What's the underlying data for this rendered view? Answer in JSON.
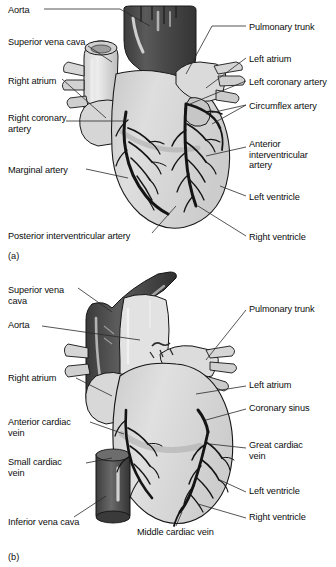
{
  "figure": {
    "colors": {
      "ink": "#0d0d0d",
      "leader": "#2a2a2a",
      "myocardium_light": "#dcdcdc",
      "myocardium_mid": "#c4c4c4",
      "myocardium_shadow": "#a9a9a9",
      "vessel_dark": "#4a4a4a",
      "vessel_darker": "#3a3a3a",
      "vessel_pale": "#e8e8e8",
      "outline": "#1a1a1a",
      "background": "#ffffff"
    }
  },
  "panels": [
    {
      "id": "a",
      "caption": "(a)",
      "view": "anterior view, coronary arteries",
      "labels_left": [
        {
          "name": "aorta",
          "text": "Aorta",
          "x": 8,
          "y": 5
        },
        {
          "name": "superior-vena-cava",
          "text": "Superior vena cava",
          "x": 8,
          "y": 37
        },
        {
          "name": "right-atrium",
          "text": "Right atrium",
          "x": 8,
          "y": 76
        },
        {
          "name": "right-coronary-artery",
          "text": "Right coronary\nartery",
          "x": 8,
          "y": 113
        },
        {
          "name": "marginal-artery",
          "text": "Marginal artery",
          "x": 8,
          "y": 165
        },
        {
          "name": "posterior-interventricular-artery",
          "text": "Posterior interventricular artery",
          "x": 8,
          "y": 231
        }
      ],
      "labels_right": [
        {
          "name": "pulmonary-trunk",
          "text": "Pulmonary trunk",
          "x": 249,
          "y": 22
        },
        {
          "name": "left-atrium",
          "text": "Left atrium",
          "x": 249,
          "y": 54
        },
        {
          "name": "left-coronary-artery",
          "text": "Left coronary artery",
          "x": 249,
          "y": 77
        },
        {
          "name": "circumflex-artery",
          "text": "Circumflex artery",
          "x": 249,
          "y": 101
        },
        {
          "name": "anterior-interventricular-artery",
          "text": "Anterior\ninterventricular\nartery",
          "x": 249,
          "y": 139
        },
        {
          "name": "left-ventricle",
          "text": "Left ventricle",
          "x": 249,
          "y": 192
        },
        {
          "name": "right-ventricle",
          "text": "Right ventricle",
          "x": 249,
          "y": 232
        }
      ]
    },
    {
      "id": "b",
      "caption": "(b)",
      "view": "anterior view, cardiac veins",
      "labels_left": [
        {
          "name": "superior-vena-cava",
          "text": "Superior vena\ncava",
          "x": 8,
          "y": 285
        },
        {
          "name": "aorta",
          "text": "Aorta",
          "x": 8,
          "y": 320
        },
        {
          "name": "right-atrium",
          "text": "Right atrium",
          "x": 8,
          "y": 373
        },
        {
          "name": "anterior-cardiac-vein",
          "text": "Anterior cardiac\nvein",
          "x": 8,
          "y": 417
        },
        {
          "name": "small-cardiac-vein",
          "text": "Small cardiac\nvein",
          "x": 8,
          "y": 457
        },
        {
          "name": "inferior-vena-cava",
          "text": "Inferior vena cava",
          "x": 8,
          "y": 517
        }
      ],
      "labels_right": [
        {
          "name": "pulmonary-trunk",
          "text": "Pulmonary trunk",
          "x": 249,
          "y": 304
        },
        {
          "name": "left-atrium",
          "text": "Left atrium",
          "x": 249,
          "y": 380
        },
        {
          "name": "coronary-sinus",
          "text": "Coronary sinus",
          "x": 249,
          "y": 403
        },
        {
          "name": "great-cardiac-vein",
          "text": "Great cardiac\nvein",
          "x": 249,
          "y": 440
        },
        {
          "name": "left-ventricle",
          "text": "Left ventricle",
          "x": 249,
          "y": 486
        },
        {
          "name": "right-ventricle",
          "text": "Right ventricle",
          "x": 249,
          "y": 512
        }
      ],
      "labels_bottom": [
        {
          "name": "middle-cardiac-vein",
          "text": "Middle cardiac vein",
          "x": 137,
          "y": 527
        }
      ]
    }
  ]
}
